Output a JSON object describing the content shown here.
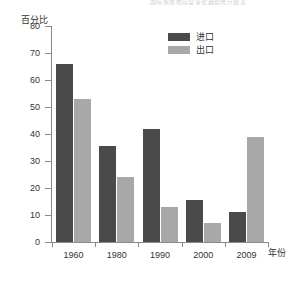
{
  "top_strip_text": "国际贸易依存度变化趋势统计图表",
  "legend": {
    "position": "top-right",
    "items": [
      {
        "label": "进口",
        "color": "#4a4a4a",
        "key": "import"
      },
      {
        "label": "出口",
        "color": "#a8a8a8",
        "key": "export"
      }
    ]
  },
  "axes": {
    "ylabel": "百分比",
    "xlabel": "年份",
    "yticks": [
      0,
      10,
      20,
      30,
      40,
      50,
      60,
      70,
      80
    ],
    "ymin": 0,
    "ymax": 80
  },
  "chart_data": {
    "type": "bar",
    "title": "",
    "subtitle": "",
    "xlabel": "年份",
    "ylabel": "百分比",
    "ylim": [
      0,
      80
    ],
    "ytick_step": 10,
    "grid": false,
    "legend_position": "top-right",
    "categories": [
      "1960",
      "1980",
      "1990",
      "2000",
      "2009"
    ],
    "series": [
      {
        "name": "进口",
        "color": "#4a4a4a",
        "values": [
          66,
          35.5,
          42,
          15.5,
          11
        ]
      },
      {
        "name": "出口",
        "color": "#a8a8a8",
        "values": [
          53,
          24,
          13,
          7,
          39
        ]
      }
    ]
  }
}
